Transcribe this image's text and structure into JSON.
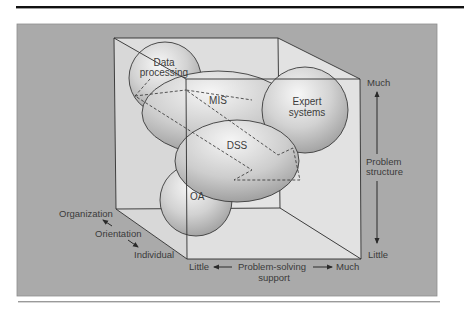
{
  "figure": {
    "colors": {
      "panel": "#a9a9a9",
      "cube_face": "#e3e3e3",
      "sphere_light": "#f4f4f4",
      "sphere_dark": "#9c9c9c",
      "line": "#2e2e2e",
      "top_rule": "#111111",
      "bottom_rule": "#9a9a9a"
    },
    "spheres": [
      {
        "id": "dp",
        "label_lines": [
          "Data",
          "processing"
        ]
      },
      {
        "id": "mis",
        "label_lines": [
          "MIS"
        ]
      },
      {
        "id": "es",
        "label_lines": [
          "Expert",
          "systems"
        ]
      },
      {
        "id": "dss",
        "label_lines": [
          "DSS"
        ]
      },
      {
        "id": "oa",
        "label_lines": [
          "OA"
        ]
      }
    ],
    "axes": {
      "orientation": {
        "title": "Orientation",
        "high": "Organization",
        "low": "Individual"
      },
      "problem_structure": {
        "title_lines": [
          "Problem",
          "structure"
        ],
        "high": "Much",
        "low": "Little"
      },
      "problem_solving_support": {
        "title_lines": [
          "Problem-solving",
          "support"
        ],
        "low": "Little",
        "high": "Much"
      }
    }
  }
}
